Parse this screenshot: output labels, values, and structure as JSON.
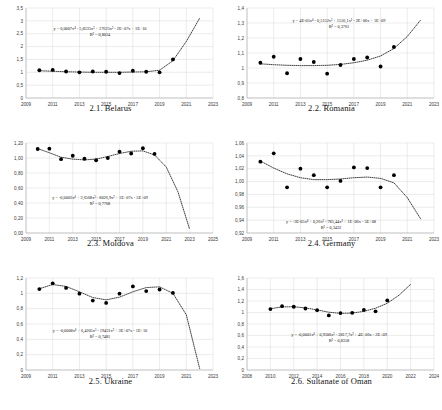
{
  "figure": {
    "panel_count": 6,
    "marker_color": "#000000",
    "trendline_style": "dotted",
    "grid": true
  },
  "chart_data": [
    {
      "type": "scatter",
      "id": "belarus",
      "title": "2.1. Belarus",
      "xlabel": "",
      "ylabel": "",
      "xlim": [
        2009,
        2023
      ],
      "ylim": [
        0,
        3.5
      ],
      "yticks": [
        "0",
        "0,5",
        "1",
        "1,5",
        "2",
        "2,5",
        "3",
        "3,5"
      ],
      "ytick_values": [
        0,
        0.5,
        1,
        1.5,
        2,
        2.5,
        3,
        3.5
      ],
      "xticks": [
        "2009",
        "2011",
        "2013",
        "2015",
        "2017",
        "2019",
        "2021",
        "2023"
      ],
      "xtick_values": [
        2009,
        2011,
        2013,
        2015,
        2017,
        2019,
        2021,
        2023
      ],
      "x": [
        2010,
        2011,
        2012,
        2013,
        2014,
        2015,
        2016,
        2017,
        2018,
        2019,
        2020
      ],
      "values": [
        1.08,
        1.09,
        1.03,
        1.0,
        1.03,
        1.02,
        0.97,
        1.06,
        1.02,
        1.0,
        1.5
      ],
      "equation": "y = 0,0007x⁴ - 5,8335x³ + 17625x² - 2E+07x + 1E+10",
      "r2": "R² = 0,8024",
      "trend_x": [
        2010,
        2011,
        2012,
        2013,
        2014,
        2015,
        2016,
        2017,
        2018,
        2019,
        2020,
        2021,
        2022
      ],
      "trend_y": [
        1.06,
        1.04,
        1.02,
        1.01,
        1.0,
        1.0,
        1.0,
        1.01,
        1.02,
        1.08,
        1.45,
        2.2,
        3.1
      ]
    },
    {
      "type": "scatter",
      "id": "romania",
      "title": "2.2. Romania",
      "xlabel": "",
      "ylabel": "",
      "xlim": [
        2009,
        2023
      ],
      "ylim": [
        0.8,
        1.4
      ],
      "yticks": [
        "0,8",
        "0,9",
        "1",
        "1,1",
        "1,2",
        "1,3",
        "1,4"
      ],
      "ytick_values": [
        0.8,
        0.9,
        1.0,
        1.1,
        1.2,
        1.3,
        1.4
      ],
      "xticks": [
        "2009",
        "2011",
        "2013",
        "2015",
        "2017",
        "2019",
        "2021",
        "2023"
      ],
      "xtick_values": [
        2009,
        2011,
        2013,
        2015,
        2017,
        2019,
        2021,
        2023
      ],
      "x": [
        2010,
        2011,
        2012,
        2013,
        2014,
        2015,
        2016,
        2017,
        2018,
        2019,
        2020
      ],
      "values": [
        1.035,
        1.075,
        0.965,
        1.06,
        1.04,
        0.962,
        1.02,
        1.06,
        1.07,
        1.01,
        1.14
      ],
      "equation": "y = 4E-05x⁴ - 0,5152x³ + 1556,1x² - 2E+06x + 1E+09",
      "r2": "R² = 0,3761",
      "trend_x": [
        2010,
        2011,
        2012,
        2013,
        2014,
        2015,
        2016,
        2017,
        2018,
        2019,
        2020,
        2021,
        2022
      ],
      "trend_y": [
        1.028,
        1.022,
        1.018,
        1.016,
        1.016,
        1.018,
        1.024,
        1.035,
        1.052,
        1.08,
        1.13,
        1.21,
        1.32
      ]
    },
    {
      "type": "scatter",
      "id": "moldova",
      "title": "2.3. Moldova",
      "xlabel": "",
      "ylabel": "",
      "xlim": [
        2009,
        2025
      ],
      "ylim": [
        0,
        1.2
      ],
      "yticks": [
        "0,00",
        "0,20",
        "0,40",
        "0,60",
        "0,80",
        "1,00",
        "1,20"
      ],
      "ytick_values": [
        0,
        0.2,
        0.4,
        0.6,
        0.8,
        1.0,
        1.2
      ],
      "xticks": [
        "2009",
        "2011",
        "2013",
        "2015",
        "2017",
        "2019",
        "2021",
        "2023",
        "2025"
      ],
      "xtick_values": [
        2009,
        2011,
        2013,
        2015,
        2017,
        2019,
        2021,
        2023,
        2025
      ],
      "x": [
        2010,
        2011,
        2012,
        2013,
        2014,
        2015,
        2016,
        2017,
        2018,
        2019,
        2020
      ],
      "values": [
        1.12,
        1.125,
        0.985,
        1.03,
        0.99,
        0.97,
        1.0,
        1.085,
        1.06,
        1.13,
        1.055
      ],
      "equation": "y = -0,0003x⁴ + 2,6568x³ - 8026,9x² + 1E+07x - 5E+09",
      "r2": "R² = 0,7768",
      "trend_x": [
        2010,
        2011,
        2012,
        2013,
        2014,
        2015,
        2016,
        2017,
        2018,
        2019,
        2020,
        2021,
        2022,
        2023
      ],
      "trend_y": [
        1.125,
        1.07,
        1.01,
        0.985,
        0.975,
        0.985,
        1.02,
        1.06,
        1.09,
        1.095,
        1.04,
        0.88,
        0.55,
        0.05
      ]
    },
    {
      "type": "scatter",
      "id": "germany",
      "title": "2.4. Germany",
      "xlabel": "",
      "ylabel": "",
      "xlim": [
        2009,
        2023
      ],
      "ylim": [
        0.92,
        1.06
      ],
      "yticks": [
        "0,92",
        "0,94",
        "0,96",
        "0,98",
        "1,00",
        "1,02",
        "1,04",
        "1,06"
      ],
      "ytick_values": [
        0.92,
        0.94,
        0.96,
        0.98,
        1.0,
        1.02,
        1.04,
        1.06
      ],
      "xticks": [
        "2009",
        "2011",
        "2013",
        "2015",
        "2017",
        "2019",
        "2021",
        "2023"
      ],
      "xtick_values": [
        2009,
        2011,
        2013,
        2015,
        2017,
        2019,
        2021,
        2023
      ],
      "x": [
        2010,
        2011,
        2012,
        2013,
        2014,
        2015,
        2016,
        2017,
        2018,
        2019,
        2020
      ],
      "values": [
        1.031,
        1.044,
        0.991,
        1.02,
        1.01,
        0.991,
        1.001,
        1.022,
        1.021,
        0.991,
        1.01
      ],
      "equation": "y = -3E-05x⁴ + 0,26x³ - 785,44x² + 1E+06x - 5E+08",
      "r2": "R² = 0,3432",
      "trend_x": [
        2010,
        2011,
        2012,
        2013,
        2014,
        2015,
        2016,
        2017,
        2018,
        2019,
        2020,
        2021,
        2022
      ],
      "trend_y": [
        1.032,
        1.021,
        1.012,
        1.006,
        1.003,
        1.003,
        1.004,
        1.006,
        1.007,
        1.005,
        0.998,
        0.975,
        0.942
      ]
    },
    {
      "type": "scatter",
      "id": "ukraine",
      "title": "2.5. Ukraine",
      "xlabel": "",
      "ylabel": "",
      "xlim": [
        2009,
        2023
      ],
      "ylim": [
        0,
        1.2
      ],
      "yticks": [
        "0",
        "0,2",
        "0,4",
        "0,6",
        "0,8",
        "1",
        "1,2"
      ],
      "ytick_values": [
        0,
        0.2,
        0.4,
        0.6,
        0.8,
        1.0,
        1.2
      ],
      "xticks": [
        "2009",
        "2011",
        "2013",
        "2015",
        "2017",
        "2019",
        "2021",
        "2023"
      ],
      "xtick_values": [
        2009,
        2011,
        2013,
        2015,
        2017,
        2019,
        2021,
        2023
      ],
      "x": [
        2010,
        2011,
        2012,
        2013,
        2014,
        2015,
        2016,
        2017,
        2018,
        2019,
        2020
      ],
      "values": [
        1.055,
        1.13,
        1.07,
        0.995,
        0.905,
        0.875,
        0.995,
        1.09,
        1.03,
        1.05,
        1.005
      ],
      "equation": "y = -0,0008x⁴ + 6,4205x³ - 19431x² + 3E+07x - 1E+10",
      "r2": "R² = 0,7481",
      "trend_x": [
        2010,
        2011,
        2012,
        2013,
        2014,
        2015,
        2016,
        2017,
        2018,
        2019,
        2020,
        2021,
        2022
      ],
      "trend_y": [
        1.06,
        1.115,
        1.09,
        1.02,
        0.945,
        0.915,
        0.95,
        1.02,
        1.075,
        1.085,
        1.0,
        0.72,
        0.02
      ]
    },
    {
      "type": "scatter",
      "id": "oman",
      "title": "2.6. Sultanate of Oman",
      "xlabel": "",
      "ylabel": "",
      "xlim": [
        2008,
        2024
      ],
      "ylim": [
        0,
        1.6
      ],
      "yticks": [
        "0",
        "0,2",
        "0,4",
        "0,6",
        "0,8",
        "1",
        "1,2",
        "1,4",
        "1,6"
      ],
      "ytick_values": [
        0,
        0.2,
        0.4,
        0.6,
        0.8,
        1.0,
        1.2,
        1.4,
        1.6
      ],
      "xticks": [
        "2008",
        "2010",
        "2012",
        "2014",
        "2016",
        "2018",
        "2020",
        "2022",
        "2024"
      ],
      "xtick_values": [
        2008,
        2010,
        2012,
        2014,
        2016,
        2018,
        2020,
        2022,
        2024
      ],
      "x": [
        2010,
        2011,
        2012,
        2013,
        2014,
        2015,
        2016,
        2017,
        2018,
        2019,
        2020
      ],
      "values": [
        1.06,
        1.11,
        1.1,
        1.07,
        1.04,
        0.95,
        0.99,
        0.995,
        1.045,
        1.02,
        1.21
      ],
      "equation": "y = -0,0001x⁴ + 0,9306x³ - 2817,7x² + 4E+06x - 2E+09",
      "r2": "R² = 0,8358",
      "trend_x": [
        2010,
        2011,
        2012,
        2013,
        2014,
        2015,
        2016,
        2017,
        2018,
        2019,
        2020,
        2021,
        2022
      ],
      "trend_y": [
        1.065,
        1.098,
        1.1,
        1.08,
        1.045,
        1.005,
        0.985,
        0.99,
        1.02,
        1.075,
        1.16,
        1.3,
        1.49
      ]
    }
  ]
}
